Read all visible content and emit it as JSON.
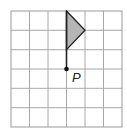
{
  "diagram": {
    "type": "grid-with-flag",
    "grid": {
      "columns": 6,
      "rows": 6,
      "line_color": "#a8a8a8",
      "border_color": "#9a9a9a"
    },
    "flag": {
      "triangle_fill": "#b5b5b5",
      "stroke_color": "#222222",
      "vertices_grid": [
        [
          3,
          0
        ],
        [
          4,
          1
        ],
        [
          3,
          2
        ]
      ],
      "stem_grid": [
        [
          3,
          2
        ],
        [
          3,
          3
        ]
      ]
    },
    "point": {
      "label": "P",
      "grid": [
        3,
        3
      ],
      "color": "#111111"
    }
  }
}
